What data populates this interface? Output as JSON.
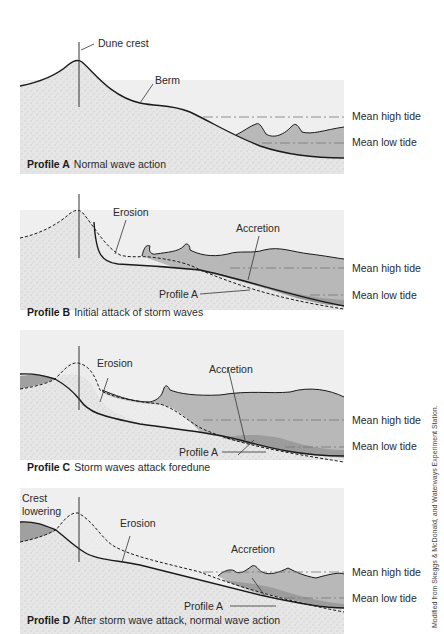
{
  "colors": {
    "panel_bg": "#f0f0f0",
    "sand": "#e4e4e4",
    "water": "#b9b9b9",
    "accretion": "#9f9f9f",
    "line": "#1a1a1a"
  },
  "tide_labels": {
    "high": "Mean high tide",
    "low": "Mean low tide"
  },
  "profiles": [
    {
      "id": "A",
      "title": "Profile A",
      "caption": "Normal wave action",
      "labels": {
        "dune_crest": "Dune crest",
        "berm": "Berm"
      }
    },
    {
      "id": "B",
      "title": "Profile B",
      "caption": "Initial attack of storm waves",
      "labels": {
        "erosion": "Erosion",
        "accretion": "Accretion",
        "profile_a": "Profile A"
      }
    },
    {
      "id": "C",
      "title": "Profile C",
      "caption": "Storm waves attack foredune",
      "labels": {
        "erosion": "Erosion",
        "accretion": "Accretion",
        "profile_a": "Profile A"
      }
    },
    {
      "id": "D",
      "title": "Profile D",
      "caption": "After storm wave attack, normal wave action",
      "labels": {
        "crest_line1": "Crest",
        "crest_line2": "lowering",
        "erosion": "Erosion",
        "accretion": "Accretion",
        "profile_a": "Profile A"
      }
    }
  ],
  "credit": "Modified from Skeggs & McDonald, and Waterways Experiment Station."
}
